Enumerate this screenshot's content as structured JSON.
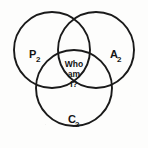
{
  "diagram": {
    "type": "venn",
    "set_count": 3,
    "background_color": "#fdfdfc",
    "stroke_color": "#1a1a1a",
    "text_color": "#141414",
    "circles": [
      {
        "id": "left",
        "label_base": "P",
        "label_sub": "2",
        "cx": 52,
        "cy": 50,
        "r": 38,
        "label_x": 29,
        "label_y": 58,
        "sub_x": 36,
        "sub_y": 62
      },
      {
        "id": "right",
        "label_base": "A",
        "label_sub": "2",
        "cx": 96,
        "cy": 50,
        "r": 38,
        "label_x": 110,
        "label_y": 58,
        "sub_x": 117,
        "sub_y": 62
      },
      {
        "id": "bottom",
        "label_base": "C",
        "label_sub": "2",
        "cx": 74,
        "cy": 88,
        "r": 38,
        "label_x": 68,
        "label_y": 123,
        "sub_x": 75,
        "sub_y": 127
      }
    ],
    "center": {
      "lines": [
        "Who",
        "am",
        "I?"
      ],
      "x": 74,
      "y_start": 67,
      "line_height": 10
    }
  }
}
